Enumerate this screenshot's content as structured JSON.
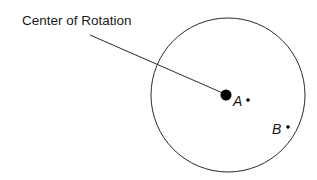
{
  "diagram": {
    "callout": {
      "text": "Center of Rotation",
      "leader_line": {
        "x1": 90,
        "y1": 35,
        "x2": 225,
        "y2": 94
      }
    },
    "circle": {
      "cx": 228,
      "cy": 95,
      "r": 77,
      "stroke": "#2a2a2a"
    },
    "center_dot": {
      "cx": 226,
      "cy": 95,
      "r": 5.5,
      "fill": "#000000"
    },
    "points": [
      {
        "label": "A",
        "dot": {
          "cx": 248,
          "cy": 100,
          "r": 1.8
        }
      },
      {
        "label": "B",
        "dot": {
          "cx": 288,
          "cy": 127,
          "r": 1.8
        }
      }
    ]
  }
}
